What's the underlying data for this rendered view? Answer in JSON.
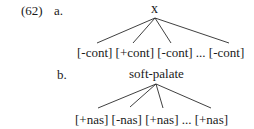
{
  "example": {
    "number": "(62)",
    "a": {
      "label": "a.",
      "root": "x",
      "leaves": [
        "[-cont]",
        "[+cont]",
        "[-cont]",
        "...",
        "[-cont]"
      ],
      "leaves_text": "[-cont] [+cont] [-cont] ... [-cont]"
    },
    "b": {
      "label": "b.",
      "root": "soft-palate",
      "leaves": [
        "[+nas]",
        "[-nas]",
        "[+nas]",
        "...",
        "[+nas]"
      ],
      "leaves_text": "[+nas] [-nas] [+nas] ... [+nas]"
    }
  }
}
